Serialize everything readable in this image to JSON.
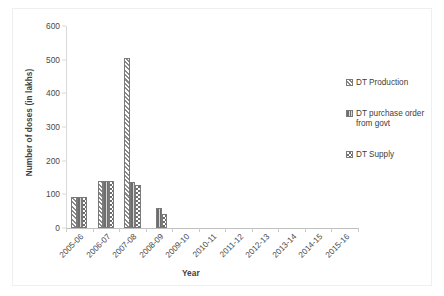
{
  "chart_data": {
    "type": "bar",
    "title": "",
    "xlabel": "Year",
    "ylabel": "Number of doses (in lakhs)",
    "ylim": [
      0,
      600
    ],
    "yticks": [
      0,
      100,
      200,
      300,
      400,
      500,
      600
    ],
    "grid": false,
    "legend_position": "right",
    "categories": [
      "2005-06",
      "2006-07",
      "2007-08",
      "2008-09",
      "2009-10",
      "2010-11",
      "2011-12",
      "2012-13",
      "2013-14",
      "2014-15",
      "2015-16"
    ],
    "series": [
      {
        "name": "DT Production",
        "pattern": "diagonal-hatch",
        "values": [
          92,
          140,
          505,
          0,
          0,
          0,
          0,
          0,
          0,
          0,
          0
        ]
      },
      {
        "name": "DT purchase order from govt",
        "pattern": "vertical-stripe-dark",
        "values": [
          92,
          140,
          137,
          58,
          0,
          0,
          0,
          0,
          0,
          0,
          0
        ]
      },
      {
        "name": "DT Supply",
        "pattern": "checkerboard",
        "values": [
          92,
          140,
          128,
          42,
          0,
          0,
          0,
          0,
          0,
          0,
          0
        ]
      }
    ]
  },
  "legend": {
    "items": [
      {
        "label": "DT Production"
      },
      {
        "label": "DT purchase order from govt"
      },
      {
        "label": "DT Supply"
      }
    ]
  },
  "axes": {
    "y_title": "Number of doses (in lakhs)",
    "x_title": "Year",
    "y_tick_labels": [
      "600",
      "500",
      "400",
      "300",
      "200",
      "100",
      "0"
    ],
    "x_tick_labels": [
      "2005-06",
      "2006-07",
      "2007-08",
      "2008-09",
      "2009-10",
      "2010-11",
      "2011-12",
      "2012-13",
      "2013-14",
      "2014-15",
      "2015-16"
    ]
  },
  "colors": {
    "series_dark": "#6e6e6e",
    "series_light": "#ffffff",
    "bar_outline": "#7a7a7a",
    "axis": "#d9d9d9",
    "text": "#404040"
  }
}
